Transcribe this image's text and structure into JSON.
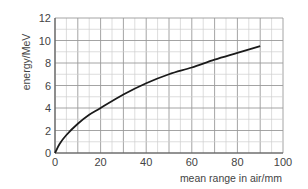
{
  "chart_data": {
    "type": "line",
    "title": "",
    "xlabel": "mean range in air/mm",
    "ylabel": "energy/MeV",
    "xlim": [
      0,
      100
    ],
    "ylim": [
      0,
      12
    ],
    "xticks": [
      0,
      20,
      40,
      60,
      80,
      100
    ],
    "yticks": [
      0,
      2,
      4,
      6,
      8,
      10,
      12
    ],
    "grid": true,
    "grid_minor_x_step": 5,
    "grid_minor_y_step": 1,
    "legend": null,
    "series": [
      {
        "name": "energy vs mean range",
        "x": [
          0,
          2,
          5,
          10,
          15,
          20,
          30,
          40,
          50,
          60,
          70,
          80,
          90
        ],
        "y": [
          0,
          0.8,
          1.6,
          2.6,
          3.4,
          4.0,
          5.2,
          6.2,
          7.0,
          7.6,
          8.3,
          8.9,
          9.5
        ]
      }
    ],
    "colors": {
      "line": "#1a1a1a",
      "grid": "#bdbdbd",
      "text": "#444444"
    }
  }
}
